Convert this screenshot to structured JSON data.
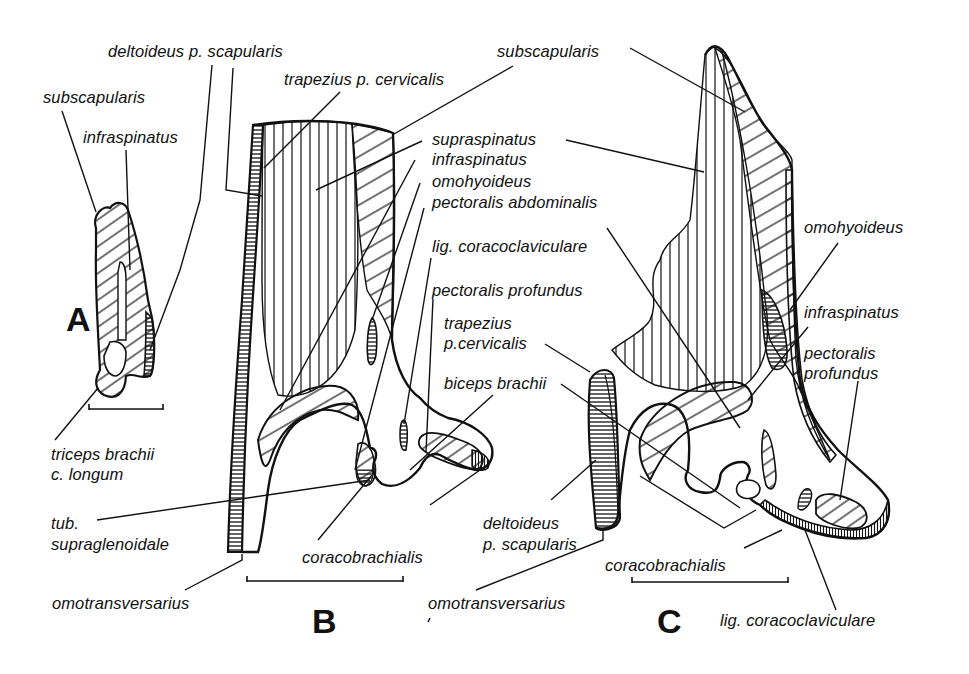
{
  "figure": {
    "panels": [
      {
        "id": "A",
        "letter": "A"
      },
      {
        "id": "B",
        "letter": "B"
      },
      {
        "id": "C",
        "letter": "C"
      }
    ],
    "colors": {
      "ink": "#111111",
      "background": "#ffffff"
    }
  },
  "labels": {
    "A": {
      "subscapularis": "subscapularis",
      "infraspinatus": "infraspinatus",
      "triceps_1": "triceps brachii",
      "triceps_2": "c. longum"
    },
    "B": {
      "deltoideus": "deltoideus p. scapularis",
      "trapezius": "trapezius p. cervicalis",
      "subscapularis": "subscapularis",
      "supraspinatus": "supraspinatus",
      "infraspinatus": "infraspinatus",
      "omohyoideus": "omohyoideus",
      "pectoralis_abdominalis": "pectoralis abdominalis",
      "lig_coracoclaviculare": "lig. coracoclaviculare",
      "pectoralis_profundus": "pectoralis profundus",
      "tub_1": "tub.",
      "tub_2": "supraglenoidale",
      "coracobrachialis": "coracobrachialis",
      "omotransversarius": "omotransversarius"
    },
    "shared": {
      "trapezius_1": "trapezius",
      "trapezius_2": "p.cervicalis",
      "biceps": "biceps brachii"
    },
    "C": {
      "omohyoideus": "omohyoideus",
      "infraspinatus": "infraspinatus",
      "pectoralis_1": "pectoralis",
      "pectoralis_2": "profundus",
      "deltoideus_1": "deltoideus",
      "deltoideus_2": "p. scapularis",
      "coracobrachialis": "coracobrachialis",
      "omotransversarius": "omotransversarius",
      "lig_coracoclaviculare": "lig. coracoclaviculare"
    }
  }
}
